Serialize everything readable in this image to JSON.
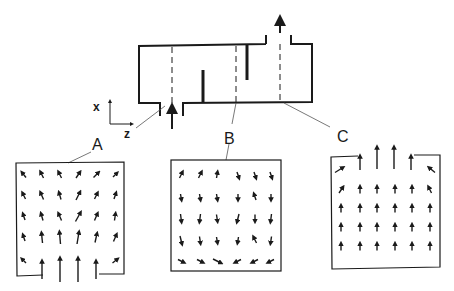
{
  "diagram": {
    "colors": {
      "ink": "#1a1a1a",
      "background": "#ffffff",
      "leader": "#555555"
    },
    "axes": {
      "vertical_label": "x",
      "horizontal_label": "z"
    },
    "sections": [
      {
        "id": "A",
        "label": "A",
        "location": "near inlet"
      },
      {
        "id": "B",
        "label": "B",
        "location": "between baffles"
      },
      {
        "id": "C",
        "label": "C",
        "location": "near outlet"
      }
    ],
    "channel": {
      "inlet_arrow": "up-arrow-icon",
      "outlet_arrow": "up-arrow-icon",
      "baffles": 2,
      "dashed_section_lines": 3
    },
    "vector_grids": {
      "A": {
        "rows": 5,
        "cols": 6,
        "pattern": "jet entering from bottom opening, spreading upward and outward"
      },
      "B": {
        "rows": 5,
        "cols": 6,
        "pattern": "mostly downward-pointing vectors, bottom row diverging to sides"
      },
      "C": {
        "rows": 5,
        "cols": 6,
        "pattern": "uniform upward vectors converging to top opening"
      }
    }
  }
}
